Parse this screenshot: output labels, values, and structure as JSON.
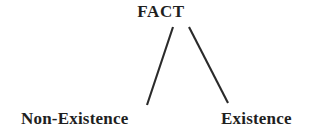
{
  "diagram": {
    "type": "tree",
    "orientation": "top-down",
    "background_color": "#ffffff",
    "stroke_color": "#2a2a2a",
    "text_color": "#1f1f1f",
    "root": {
      "id": "fact",
      "label": "FACT"
    },
    "leaves": [
      {
        "id": "non-existence",
        "label": "Non-Existence",
        "position": "bottom-left"
      },
      {
        "id": "existence",
        "label": "Existence",
        "position": "bottom-right"
      }
    ],
    "edges": [
      {
        "id": "edge-fact-non-existence",
        "from": "fact",
        "to": "non-existence",
        "x1": 173,
        "y1": 27,
        "x2": 147,
        "y2": 105
      },
      {
        "id": "edge-fact-existence",
        "from": "fact",
        "to": "existence",
        "x1": 189,
        "y1": 27,
        "x2": 228,
        "y2": 103
      }
    ]
  }
}
